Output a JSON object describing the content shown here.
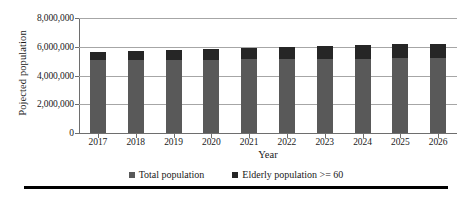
{
  "chart_data": {
    "type": "bar",
    "title": "",
    "xlabel": "Year",
    "ylabel": "Pojected population",
    "categories": [
      "2017",
      "2018",
      "2019",
      "2020",
      "2021",
      "2022",
      "2023",
      "2024",
      "2025",
      "2026"
    ],
    "series": [
      {
        "name": "Total population",
        "values": [
          5650000,
          5730000,
          5800000,
          5870000,
          5940000,
          6000000,
          6060000,
          6110000,
          6170000,
          6210000
        ]
      },
      {
        "name": "Elderly population >= 60",
        "values": [
          600000,
          650000,
          700000,
          760000,
          820000,
          870000,
          900000,
          940000,
          980000,
          1020000
        ]
      }
    ],
    "ylim": [
      0,
      8000000
    ],
    "y_ticks": [
      0,
      2000000,
      4000000,
      6000000,
      8000000
    ],
    "y_tick_labels": [
      "0",
      "2,000,000",
      "4,000,000",
      "6,000,000",
      "8,000,000"
    ],
    "grid": true,
    "legend_position": "bottom",
    "colors": {
      "total_population": "#595959",
      "elderly_population": "#262626",
      "gridline": "#a6a6a6",
      "axis": "#6e6e6e",
      "rule": "#000000"
    }
  },
  "legend": {
    "items": [
      {
        "label": "Total population",
        "color": "#595959"
      },
      {
        "label": "Elderly population >= 60",
        "color": "#262626"
      }
    ]
  }
}
